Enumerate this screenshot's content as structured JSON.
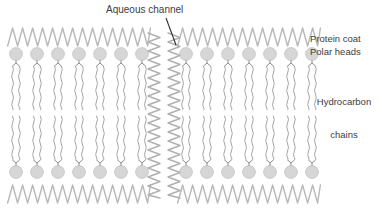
{
  "figure": {
    "type": "diagram",
    "background_color": "#ffffff"
  },
  "labels": {
    "aqueous_channel": "Aqueous channel",
    "protein_coat": "Protein coat",
    "polar_heads": "Polar heads",
    "hydrocarbon_line1": "Hydrocarbon",
    "hydrocarbon_line2": "chains"
  },
  "colors": {
    "head_fill": "#d6d6d6",
    "head_stroke": "#c4c4c4",
    "protein_coat": "#b8b8b8",
    "channel_wall": "#b0b0b0",
    "chain_stroke": "#8e8e8e",
    "stem_stroke": "#6f6f6f",
    "leader_line": "#2f2f2f",
    "text": "#3d3d3d"
  },
  "structure": {
    "left_bilayer": {
      "head_count_per_row": 7,
      "first_head_cx": 16,
      "head_pitch": 21,
      "head_radius": 6.4
    },
    "right_bilayer": {
      "head_count_per_row": 7,
      "first_head_cx": 186,
      "head_pitch": 21,
      "head_radius": 6.4
    },
    "rows": {
      "top_head_cy": 54,
      "bottom_head_cy": 172
    },
    "protein_coat": {
      "top_y_center": 37,
      "bottom_y_center": 194,
      "amplitude": 9,
      "period": 10
    },
    "chains": {
      "upper_top_y": 66,
      "upper_bottom_y": 110,
      "lower_top_y": 116,
      "lower_bottom_y": 160,
      "wiggle_amplitude": 1.8,
      "wiggle_period": 7,
      "pair_offset": 3.4
    },
    "aqueous_channel": {
      "left_wall_x": 154,
      "right_wall_x": 174,
      "top_y": 33,
      "bottom_y": 198,
      "amplitude": 6,
      "period": 9
    },
    "leader_line": {
      "x1": 166,
      "y1": 18,
      "x2": 176,
      "y2": 45
    }
  }
}
